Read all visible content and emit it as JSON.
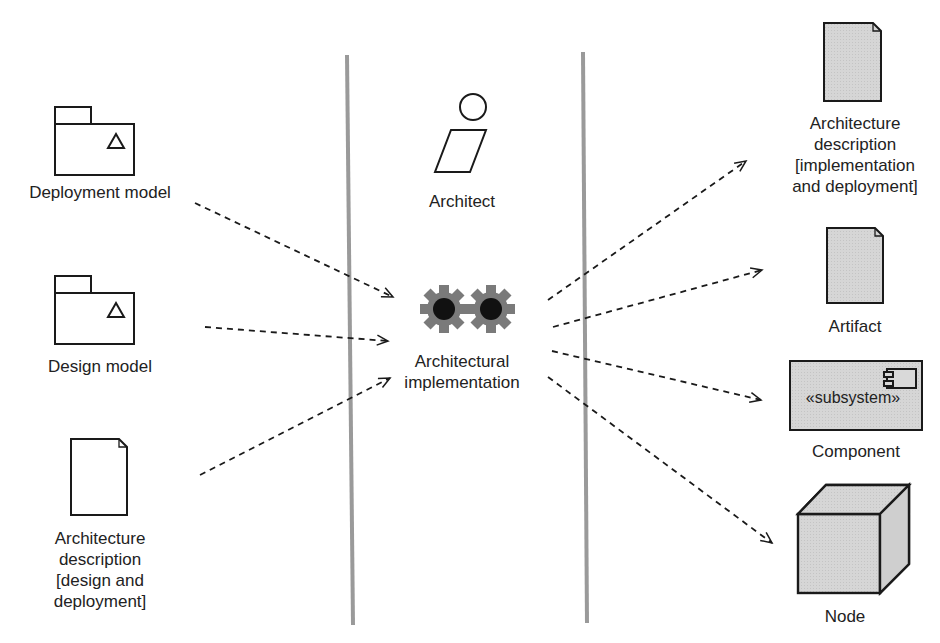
{
  "inputs": [
    {
      "label": "Deployment model",
      "icon": "package-icon"
    },
    {
      "label": "Design model",
      "icon": "package-icon"
    },
    {
      "label_lines": [
        "Architecture",
        "description",
        "[design and",
        "deployment]"
      ],
      "icon": "document-icon"
    }
  ],
  "center": {
    "worker": {
      "label": "Architect",
      "icon": "worker-icon"
    },
    "activity": {
      "label_lines": [
        "Architectural",
        "implementation"
      ],
      "icon": "gears-icon"
    }
  },
  "outputs": [
    {
      "label_lines": [
        "Architecture",
        "description",
        "[implementation",
        "and deployment]"
      ],
      "icon": "document-icon"
    },
    {
      "label": "Artifact",
      "icon": "document-icon"
    },
    {
      "label": "Component",
      "stereotype": "«subsystem»",
      "icon": "component-icon"
    },
    {
      "label": "Node",
      "icon": "node-icon"
    }
  ],
  "colors": {
    "gear": "#7a7a7a",
    "fill_gray": "#d9d9d9",
    "divider": "#9a9a9a",
    "stroke": "#1a1a1a"
  }
}
